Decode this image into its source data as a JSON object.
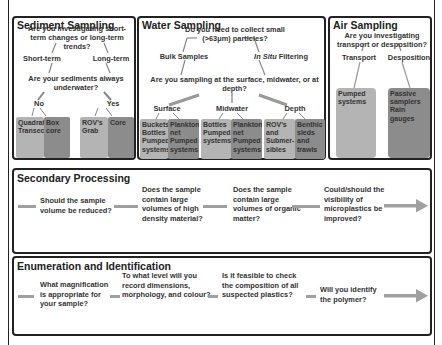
{
  "sediment": {
    "title": "Sediment Sampling",
    "q1": "Are you investigating short-term changes or long-term trends?",
    "short_term": "Short-term",
    "long_term": "Long-term",
    "q2": "Are your sediments always underwater?",
    "no": "No",
    "yes": "Yes",
    "methods": [
      {
        "label": "Quadrat Transect",
        "shade": "light"
      },
      {
        "label": "Box core",
        "shade": "dark"
      },
      {
        "label": "ROV's Grab",
        "shade": "light"
      },
      {
        "label": "Core",
        "shade": "dark"
      }
    ]
  },
  "water": {
    "title": "Water Sampling",
    "q1": "Do you need to collect small (>63μm) particles?",
    "bulk": "Bulk Samples",
    "in_situ_italic": "In Situ",
    "in_situ_rest": " Filtering",
    "q2": "Are you sampling at the surface, midwater, or at depth?",
    "surface": "Surface",
    "midwater": "Midwater",
    "depth": "Depth",
    "methods": [
      {
        "label": "Buckets Bottles Pumped systems",
        "shade": "light"
      },
      {
        "label": "Plankton net Pumped systems",
        "shade": "dark"
      },
      {
        "label": "Bottles Pumped systems",
        "shade": "light"
      },
      {
        "label": "Plankton net Pumped systems",
        "shade": "dark"
      },
      {
        "label": "ROV's and Submer-sibles",
        "shade": "light"
      },
      {
        "label": "Benthic sleds and trawls",
        "shade": "dark"
      }
    ]
  },
  "air": {
    "title": "Air Sampling",
    "q1": "Are you investigating transport or desposition?",
    "transport": "Transport",
    "deposition": "Desposition",
    "methods": [
      {
        "label": "Pumped systems",
        "shade": "light"
      },
      {
        "label": "Passive samplers Rain gauges",
        "shade": "dark"
      }
    ]
  },
  "secondary": {
    "title": "Secondary Processing",
    "steps": [
      "Should the sample volume be reduced?",
      "Does the sample contain large volumes of high density material?",
      "Does the sample contain large volumes of organic matter?",
      "Could/should the visibility of microplastics be improved?"
    ]
  },
  "enumeration": {
    "title": "Enumeration and Identification",
    "steps": [
      "What magnification is appropriate for your sample?",
      "To what level will you record dimensions, morphology, and colour?",
      "Is it feasible to check the composition of all suspected plastics?",
      "Will you identify the polymer?"
    ]
  },
  "colors": {
    "light_box": "#b4b4b4",
    "dark_box": "#8c8c8c",
    "connector": "#a0a0a0",
    "border": "#222222"
  }
}
